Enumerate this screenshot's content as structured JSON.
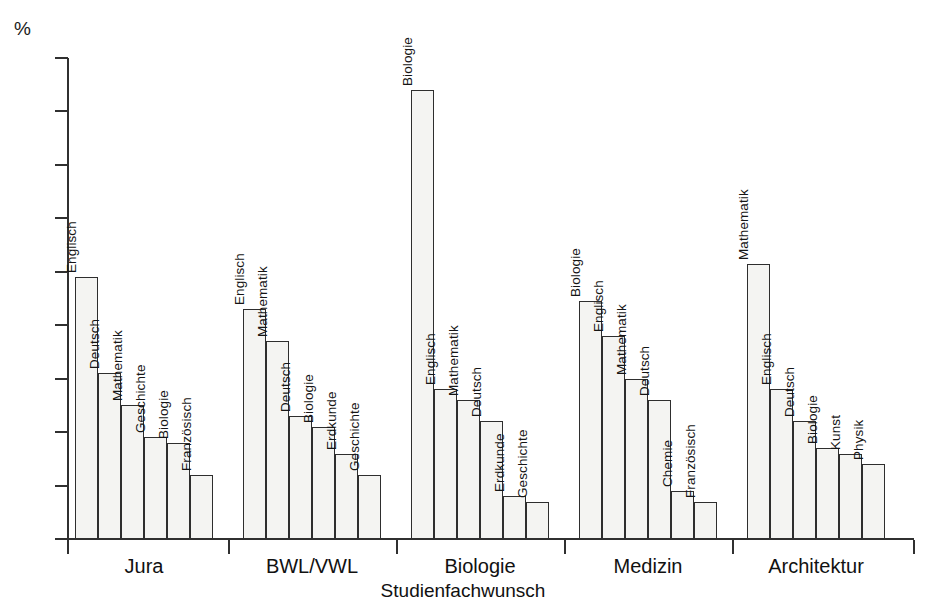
{
  "chart_data": {
    "type": "bar",
    "title": "",
    "xlabel": "Studienfachwunsch",
    "ylabel": "%",
    "ylim": [
      0,
      90
    ],
    "ytick_step": 10,
    "yticks": [
      90,
      80,
      70,
      60,
      50,
      40,
      30,
      20,
      10,
      0
    ],
    "grid": false,
    "legend": "none",
    "categories": [
      "Jura",
      "BWL/VWL",
      "Biologie",
      "Medizin",
      "Architektur"
    ],
    "groups": [
      {
        "name": "Jura",
        "bars": [
          {
            "label": "Englisch",
            "value": 49
          },
          {
            "label": "Deutsch",
            "value": 31
          },
          {
            "label": "Mathematik",
            "value": 25
          },
          {
            "label": "Geschichte",
            "value": 19
          },
          {
            "label": "Biologie",
            "value": 18
          },
          {
            "label": "Französisch",
            "value": 12
          }
        ]
      },
      {
        "name": "BWL/VWL",
        "bars": [
          {
            "label": "Englisch",
            "value": 43
          },
          {
            "label": "Mathematik",
            "value": 37
          },
          {
            "label": "Deutsch",
            "value": 23
          },
          {
            "label": "Biologie",
            "value": 21
          },
          {
            "label": "Erdkunde",
            "value": 16
          },
          {
            "label": "Geschichte",
            "value": 12
          }
        ]
      },
      {
        "name": "Biologie",
        "bars": [
          {
            "label": "Biologie",
            "value": 84
          },
          {
            "label": "Englisch",
            "value": 28
          },
          {
            "label": "Mathematik",
            "value": 26
          },
          {
            "label": "Deutsch",
            "value": 22
          },
          {
            "label": "Erdkunde",
            "value": 8
          },
          {
            "label": "Geschichte",
            "value": 7
          }
        ]
      },
      {
        "name": "Medizin",
        "bars": [
          {
            "label": "Biologie",
            "value": 44.5
          },
          {
            "label": "Englisch",
            "value": 38
          },
          {
            "label": "Mathematik",
            "value": 30
          },
          {
            "label": "Deutsch",
            "value": 26
          },
          {
            "label": "Chemie",
            "value": 9
          },
          {
            "label": "Französisch",
            "value": 7
          }
        ]
      },
      {
        "name": "Architektur",
        "bars": [
          {
            "label": "Mathematik",
            "value": 51.5
          },
          {
            "label": "Englisch",
            "value": 28
          },
          {
            "label": "Deutsch",
            "value": 22
          },
          {
            "label": "Biologie",
            "value": 17
          },
          {
            "label": "Kunst",
            "value": 16
          },
          {
            "label": "Physik",
            "value": 14
          }
        ]
      }
    ],
    "colors": {
      "bar_fill": "#f4f4f2",
      "bar_border": "#2e2e2e",
      "axis": "#303030",
      "text": "#111111",
      "background": "#ffffff"
    }
  }
}
